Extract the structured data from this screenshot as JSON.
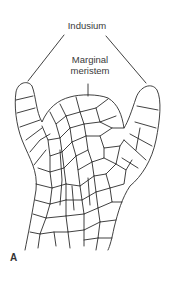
{
  "figure": {
    "panel_label": "A",
    "labels": {
      "indusium": "Indusium",
      "marginal_meristem_line1": "Marginal",
      "marginal_meristem_line2": "meristem"
    },
    "colors": {
      "line": "#2b2b2b",
      "text": "#3a3a3a",
      "background": "#ffffff"
    }
  }
}
